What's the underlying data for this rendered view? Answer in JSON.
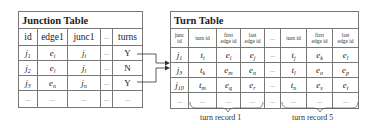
{
  "junction_table": {
    "title": "Junction Table",
    "columns": [
      "id",
      "edge1",
      "junc1",
      "...",
      "turns"
    ],
    "rows": [
      {
        "id": "j",
        "id_sub": "1",
        "edge1": "e",
        "edge1_sub": "i",
        "junc1": "j",
        "junc1_sub": "i",
        "more": "...",
        "turns": "Y"
      },
      {
        "id": "j",
        "id_sub": "2",
        "edge1": "e",
        "edge1_sub": "l",
        "junc1": "j",
        "junc1_sub": "l",
        "more": "...",
        "turns": "N"
      },
      {
        "id": "j",
        "id_sub": "3",
        "edge1": "e",
        "edge1_sub": "n",
        "junc1": "j",
        "junc1_sub": "n",
        "more": "...",
        "turns": "Y"
      },
      {
        "id": "...",
        "edge1": "...",
        "junc1": "...",
        "more": "...",
        "turns": "..."
      }
    ]
  },
  "turn_table": {
    "title": "Turn Table",
    "columns": [
      {
        "l1": "junc",
        "l2": "id"
      },
      {
        "l1": "turn id",
        "l2": ""
      },
      {
        "l1": "first",
        "l2": "edge id"
      },
      {
        "l1": "last",
        "l2": "edge id"
      },
      {
        "l1": "...",
        "l2": ""
      },
      {
        "l1": "turn id",
        "l2": ""
      },
      {
        "l1": "first",
        "l2": "edge id"
      },
      {
        "l1": "last",
        "l2": "edge id"
      }
    ],
    "rows": [
      {
        "junc": "j",
        "junc_sub": "1",
        "t1": "t",
        "t1_sub": "i",
        "f1": "e",
        "f1_sub": "i",
        "l1": "e",
        "l1_sub": "j",
        "more": "...",
        "t5": "t",
        "t5_sub": "j",
        "f5": "e",
        "f5_sub": "k",
        "l5": "e",
        "l5_sub": "l"
      },
      {
        "junc": "j",
        "junc_sub": "3",
        "t1": "t",
        "t1_sub": "k",
        "f1": "e",
        "f1_sub": "m",
        "l1": "e",
        "l1_sub": "n",
        "more": "...",
        "t5": "t",
        "t5_sub": "l",
        "f5": "e",
        "f5_sub": "o",
        "l5": "e",
        "l5_sub": "p"
      },
      {
        "junc": "j",
        "junc_sub": "10",
        "t1": "t",
        "t1_sub": "m",
        "f1": "e",
        "f1_sub": "q",
        "l1": "e",
        "l1_sub": "r",
        "more": "...",
        "t5": "t",
        "t5_sub": "n",
        "f5": "e",
        "f5_sub": "s",
        "l5": "e",
        "l5_sub": "t"
      },
      {
        "junc": "...",
        "t1": "...",
        "f1": "...",
        "l1": "...",
        "more": "...",
        "t5": "...",
        "f5": "...",
        "l5": "..."
      }
    ]
  },
  "annotations": {
    "brace_1_label": "turn record 1",
    "brace_5_label": "turn record 5"
  },
  "colors": {
    "border": "#777777",
    "line": "#333333",
    "text": "#222222"
  }
}
